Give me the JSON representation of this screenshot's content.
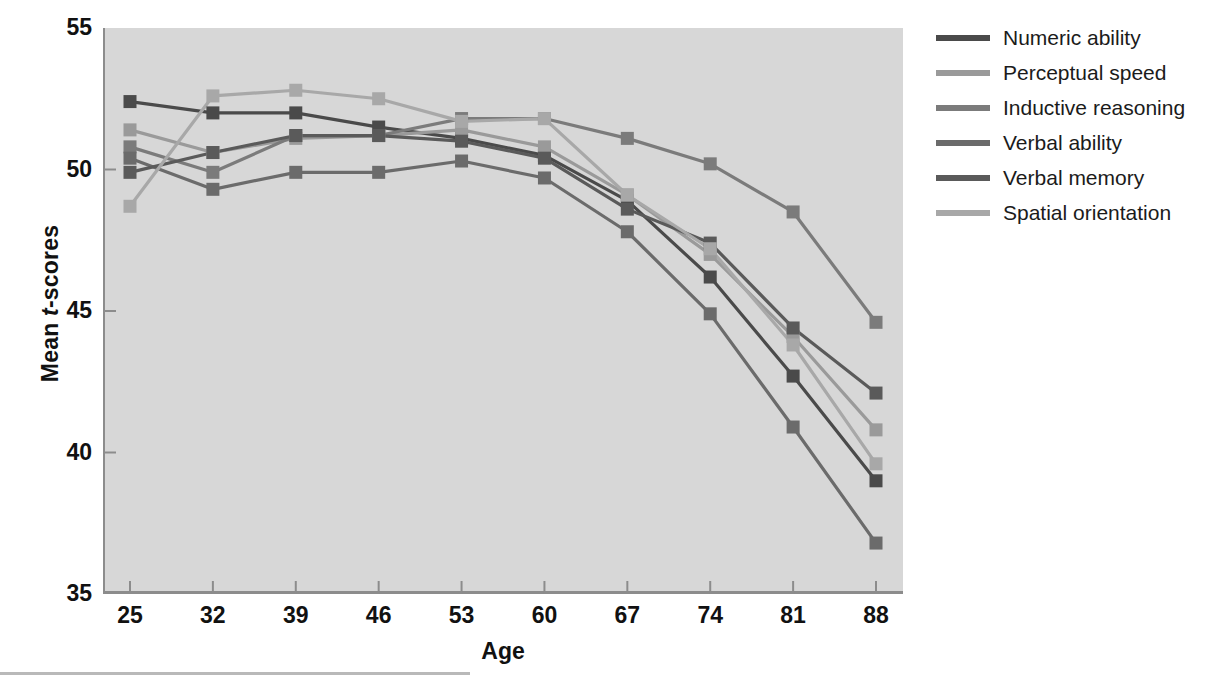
{
  "chart_data": {
    "type": "line",
    "title": "",
    "xlabel": "Age",
    "ylabel": "Mean t-scores",
    "ylabel_parts": {
      "prefix": "Mean ",
      "italic": "t",
      "suffix": "-scores"
    },
    "x": [
      25,
      32,
      39,
      46,
      53,
      60,
      67,
      74,
      81,
      88
    ],
    "categories": [
      "25",
      "32",
      "39",
      "46",
      "53",
      "60",
      "67",
      "74",
      "81",
      "88"
    ],
    "xlim": [
      25,
      88
    ],
    "ylim": [
      35,
      55
    ],
    "yticks": [
      35,
      40,
      45,
      50,
      55
    ],
    "xticks": [
      25,
      32,
      39,
      46,
      53,
      60,
      67,
      74,
      81,
      88
    ],
    "grid": false,
    "legend_position": "right",
    "marker": "square",
    "plot_background": "#d7d7d7",
    "series": [
      {
        "name": "Numeric ability",
        "color": "#4a4a4a",
        "values": [
          52.4,
          52.0,
          52.0,
          51.5,
          51.1,
          50.5,
          48.9,
          46.2,
          42.7,
          39.0
        ]
      },
      {
        "name": "Perceptual speed",
        "color": "#9a9a9a",
        "values": [
          51.4,
          50.6,
          51.1,
          51.2,
          51.4,
          50.8,
          49.1,
          47.0,
          44.1,
          40.8
        ]
      },
      {
        "name": "Inductive reasoning",
        "color": "#7b7b7b",
        "values": [
          50.8,
          49.9,
          51.2,
          51.2,
          51.8,
          51.8,
          51.1,
          50.2,
          48.5,
          44.6
        ]
      },
      {
        "name": "Verbal ability",
        "color": "#6b6b6b",
        "values": [
          50.4,
          49.3,
          49.9,
          49.9,
          50.3,
          49.7,
          47.8,
          44.9,
          40.9,
          36.8
        ]
      },
      {
        "name": "Verbal memory",
        "color": "#5a5a5a",
        "values": [
          49.9,
          50.6,
          51.2,
          51.2,
          51.0,
          50.4,
          48.6,
          47.4,
          44.4,
          42.1
        ]
      },
      {
        "name": "Spatial orientation",
        "color": "#a8a8a8",
        "values": [
          48.7,
          52.6,
          52.8,
          52.5,
          51.7,
          51.8,
          49.1,
          47.2,
          43.8,
          39.6
        ]
      }
    ]
  },
  "legend": {
    "items": [
      {
        "label": "Numeric ability",
        "color": "#4a4a4a"
      },
      {
        "label": "Perceptual speed",
        "color": "#9a9a9a"
      },
      {
        "label": "Inductive reasoning",
        "color": "#7b7b7b"
      },
      {
        "label": "Verbal ability",
        "color": "#6b6b6b"
      },
      {
        "label": "Verbal memory",
        "color": "#5a5a5a"
      },
      {
        "label": "Spatial orientation",
        "color": "#a8a8a8"
      }
    ]
  },
  "axes": {
    "y_tick_labels": [
      "55",
      "50",
      "45",
      "40",
      "35"
    ],
    "x_tick_labels": [
      "25",
      "32",
      "39",
      "46",
      "53",
      "60",
      "67",
      "74",
      "81",
      "88"
    ],
    "x_title": "Age"
  }
}
